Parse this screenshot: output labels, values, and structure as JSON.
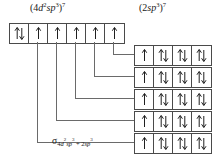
{
  "diagram": {
    "title_left": "(4d2sp3)7",
    "title_right": "(2sp3)7",
    "bottom_label": "sigma 4d2sp3 + 2sp3",
    "line_color": "#6a6a6a",
    "box_border_color": "#4a4a4a",
    "background": "#ffffff",
    "text_color": "#1a1a1a"
  },
  "labels": {
    "left": {
      "open_paren": "(",
      "n_left": "4",
      "orbital_d": "d",
      "d_exp": "2",
      "orbital_s": "s",
      "orbital_p": "p",
      "p_exp": "3",
      "close_paren": ")",
      "electrons": "7"
    },
    "right": {
      "open_paren": "(",
      "n_left": "2",
      "orbital_s": "s",
      "orbital_p": "p",
      "p_exp": "3",
      "close_paren": ")",
      "electrons": "7"
    },
    "sigma": {
      "symbol": "σ",
      "sub_left_n": "4",
      "sub_left_d": "d",
      "sub_left_d_exp": "2",
      "sub_left_sp": "sp",
      "sub_left_sp_exp": "3",
      "plus": "+",
      "sub_right_n": "2",
      "sub_right_sp": "sp",
      "sub_right_sp_exp": "3"
    }
  },
  "top_row": {
    "name": "metal-hybrid-orbitals",
    "box_count": 6,
    "boxes": [
      {
        "index": 0,
        "occupancy": "paired",
        "arrows": "up-down",
        "electrons": 2
      },
      {
        "index": 1,
        "occupancy": "single",
        "arrows": "up",
        "electrons": 1
      },
      {
        "index": 2,
        "occupancy": "single",
        "arrows": "up",
        "electrons": 1
      },
      {
        "index": 3,
        "occupancy": "single",
        "arrows": "up",
        "electrons": 1
      },
      {
        "index": 4,
        "occupancy": "single",
        "arrows": "up",
        "electrons": 1
      },
      {
        "index": 5,
        "occupancy": "single",
        "arrows": "up",
        "electrons": 1
      }
    ]
  },
  "right_rows": {
    "name": "ligand-hybrid-orbitals",
    "row_count": 5,
    "box_count_per_row": 4,
    "rows": [
      {
        "index": 0,
        "boxes": [
          {
            "index": 0,
            "occupancy": "single",
            "arrows": "up",
            "electrons": 1
          },
          {
            "index": 1,
            "occupancy": "paired",
            "arrows": "up-down",
            "electrons": 2
          },
          {
            "index": 2,
            "occupancy": "paired",
            "arrows": "up-down",
            "electrons": 2
          },
          {
            "index": 3,
            "occupancy": "paired",
            "arrows": "up-down",
            "electrons": 2
          }
        ]
      },
      {
        "index": 1,
        "boxes": [
          {
            "index": 0,
            "occupancy": "single",
            "arrows": "up",
            "electrons": 1
          },
          {
            "index": 1,
            "occupancy": "paired",
            "arrows": "up-down",
            "electrons": 2
          },
          {
            "index": 2,
            "occupancy": "paired",
            "arrows": "up-down",
            "electrons": 2
          },
          {
            "index": 3,
            "occupancy": "paired",
            "arrows": "up-down",
            "electrons": 2
          }
        ]
      },
      {
        "index": 2,
        "boxes": [
          {
            "index": 0,
            "occupancy": "single",
            "arrows": "up",
            "electrons": 1
          },
          {
            "index": 1,
            "occupancy": "paired",
            "arrows": "up-down",
            "electrons": 2
          },
          {
            "index": 2,
            "occupancy": "paired",
            "arrows": "up-down",
            "electrons": 2
          },
          {
            "index": 3,
            "occupancy": "paired",
            "arrows": "up-down",
            "electrons": 2
          }
        ]
      },
      {
        "index": 3,
        "boxes": [
          {
            "index": 0,
            "occupancy": "single",
            "arrows": "up",
            "electrons": 1
          },
          {
            "index": 1,
            "occupancy": "paired",
            "arrows": "up-down",
            "electrons": 2
          },
          {
            "index": 2,
            "occupancy": "paired",
            "arrows": "up-down",
            "electrons": 2
          },
          {
            "index": 3,
            "occupancy": "paired",
            "arrows": "up-down",
            "electrons": 2
          }
        ]
      },
      {
        "index": 4,
        "boxes": [
          {
            "index": 0,
            "occupancy": "single",
            "arrows": "up",
            "electrons": 1
          },
          {
            "index": 1,
            "occupancy": "paired",
            "arrows": "up-down",
            "electrons": 2
          },
          {
            "index": 2,
            "occupancy": "paired",
            "arrows": "up-down",
            "electrons": 2
          },
          {
            "index": 3,
            "occupancy": "paired",
            "arrows": "up-down",
            "electrons": 2
          }
        ]
      }
    ]
  },
  "bonds": {
    "name": "sigma-bond-connectors",
    "count": 5,
    "connectors": [
      {
        "from_top_box": 5,
        "to_right_row": 0
      },
      {
        "from_top_box": 4,
        "to_right_row": 1
      },
      {
        "from_top_box": 3,
        "to_right_row": 2
      },
      {
        "from_top_box": 2,
        "to_right_row": 3
      },
      {
        "from_top_box": 1,
        "to_right_row": 4
      }
    ]
  }
}
